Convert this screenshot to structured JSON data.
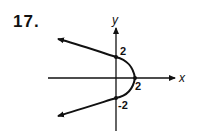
{
  "problem_number": "17.",
  "axes": {
    "x_label": "x",
    "y_label": "y"
  },
  "labels": {
    "y_pos": "2",
    "x_pos": "2",
    "y_neg": "-2"
  },
  "curve": {
    "equation": "x = 2 - y^2/2",
    "vertex": [
      2,
      0
    ],
    "y_intercepts": [
      2,
      -2
    ],
    "opens": "left"
  },
  "colors": {
    "ink": "#111111"
  }
}
